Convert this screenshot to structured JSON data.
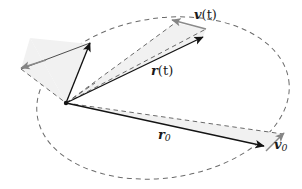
{
  "figure": {
    "background_color": "#ffffff",
    "stroke_color": "#1a1a1a",
    "dashed_color": "#595959",
    "grey_arrow_color": "#808080",
    "fill_color": "#f0f0f0",
    "labels": {
      "v_t": {
        "symbol": "v",
        "arg": "(t)",
        "text": "v(t)"
      },
      "r_t": {
        "symbol": "r",
        "arg": "(t)",
        "text": "r(t)"
      },
      "r_0": {
        "symbol": "r",
        "sub": "0",
        "text": "r0"
      },
      "v_0": {
        "symbol": "v",
        "sub": "0",
        "text": "v0"
      }
    },
    "geometry": {
      "origin": {
        "x": 66,
        "y": 103
      },
      "r_t_tip": {
        "x": 203,
        "y": 37
      },
      "v_t_tip": {
        "x": 172,
        "y": 20
      },
      "v_t_tail": {
        "x": 206,
        "y": 29
      },
      "r_0_tip": {
        "x": 264,
        "y": 146
      },
      "v_0_tip": {
        "x": 283,
        "y": 134
      },
      "v_0_tail": {
        "x": 266,
        "y": 150
      },
      "left_black_tip": {
        "x": 90,
        "y": 43
      },
      "left_grey_tip": {
        "x": 21,
        "y": 68
      },
      "left_apex": {
        "x": 30,
        "y": 38
      },
      "ellipse": {
        "center_x": 163,
        "center_y": 98,
        "radius_x": 127,
        "radius_y": 80,
        "rotation_deg": -8
      }
    }
  }
}
